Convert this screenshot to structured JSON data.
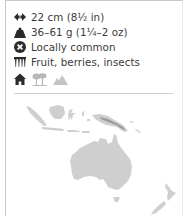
{
  "facts": {
    "length": {
      "icon": "length-arrows-icon",
      "text": "22 cm (8½ in)"
    },
    "weight": {
      "icon": "weight-icon",
      "text": "36–61 g (1¼–2 oz)"
    },
    "status": {
      "icon": "status-icon",
      "text": "Locally common"
    },
    "diet": {
      "icon": "diet-icon",
      "text": "Fruit, berries, insects"
    }
  },
  "habitats": [
    {
      "icon": "urban-house-icon",
      "active": true
    },
    {
      "icon": "woodland-trees-icon",
      "active": false
    },
    {
      "icon": "mountain-icon",
      "active": false
    }
  ],
  "map": {
    "region": "Australasia",
    "land_color": "#c9c9c9",
    "range_color": "#8a8a8a"
  },
  "colors": {
    "text": "#3a3a3a",
    "icon_active": "#2b2b2b",
    "icon_inactive": "#b8b8b8",
    "border": "#c8c8c8"
  }
}
